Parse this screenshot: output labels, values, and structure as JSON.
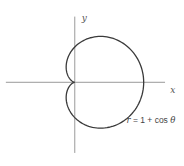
{
  "chart_data": {
    "type": "line",
    "title": "",
    "xlabel": "x",
    "ylabel": "y",
    "curve": {
      "kind": "polar",
      "equation_label": {
        "r": "r",
        "eq": " = 1 + cos ",
        "theta": "θ"
      },
      "function": "r = 1 + cos(theta)",
      "theta_range_deg": [
        0,
        360
      ],
      "key_points": [
        {
          "theta_deg": 0,
          "r": 2,
          "x": 2,
          "y": 0
        },
        {
          "theta_deg": 60,
          "r": 1.5,
          "x": 0.75,
          "y": 1.299
        },
        {
          "theta_deg": 90,
          "r": 1,
          "x": 0,
          "y": 1
        },
        {
          "theta_deg": 180,
          "r": 0,
          "x": 0,
          "y": 0
        },
        {
          "theta_deg": 270,
          "r": 1,
          "x": 0,
          "y": -1
        },
        {
          "theta_deg": 300,
          "r": 1.5,
          "x": 0.75,
          "y": -1.299
        }
      ]
    },
    "xlim": [
      -2.17,
      3.17
    ],
    "ylim": [
      -2.37,
      2.33
    ],
    "grid": false,
    "legend": "none",
    "colors": {
      "curve": "#3a3a3a",
      "axes": "#9a9a9a"
    }
  }
}
